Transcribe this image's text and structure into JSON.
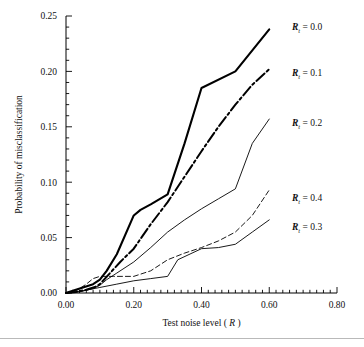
{
  "figure": {
    "background": "#ffffff",
    "line_color": "#000000",
    "footer_rule_color": "#b9b9b9"
  },
  "chart_data": {
    "type": "line",
    "title": "",
    "xlabel_prefix": "Test noise level (",
    "xlabel_symbol": "R",
    "xlabel_suffix": ")",
    "ylabel": "Probability of misclassification",
    "xlim": [
      0.0,
      0.8
    ],
    "ylim": [
      0.0,
      0.25
    ],
    "xticks": [
      0.0,
      0.2,
      0.4,
      0.6,
      0.8
    ],
    "xtick_labels": [
      "0.00",
      "0.20",
      "0.40",
      "0.60",
      "0.80"
    ],
    "yticks": [
      0.0,
      0.05,
      0.1,
      0.15,
      0.2,
      0.25
    ],
    "ytick_labels": [
      "0.00",
      "0.05",
      "0.10",
      "0.15",
      "0.20",
      "0.25"
    ],
    "x_minor_step": 0.02,
    "y_minor_step": 0.01,
    "grid": false,
    "legend_position": "right-inline",
    "series": [
      {
        "name": "Rt = 0.0",
        "label_symbol": "R",
        "label_subscript": "t",
        "label_value": "= 0.0",
        "style": "solid",
        "width": 2.1,
        "x": [
          0.0,
          0.02,
          0.05,
          0.08,
          0.1,
          0.12,
          0.15,
          0.2,
          0.22,
          0.25,
          0.3,
          0.35,
          0.4,
          0.5,
          0.6
        ],
        "y": [
          0.0,
          0.002,
          0.005,
          0.008,
          0.012,
          0.02,
          0.035,
          0.07,
          0.075,
          0.08,
          0.089,
          0.135,
          0.185,
          0.2,
          0.238
        ]
      },
      {
        "name": "Rt = 0.1",
        "label_symbol": "R",
        "label_subscript": "t",
        "label_value": "= 0.1",
        "style": "dashdot",
        "width": 2.0,
        "x": [
          0.0,
          0.03,
          0.06,
          0.09,
          0.1,
          0.13,
          0.16,
          0.2,
          0.25,
          0.3,
          0.35,
          0.4,
          0.45,
          0.5,
          0.55,
          0.6
        ],
        "y": [
          0.0,
          0.001,
          0.003,
          0.006,
          0.008,
          0.018,
          0.028,
          0.04,
          0.062,
          0.082,
          0.105,
          0.128,
          0.15,
          0.17,
          0.188,
          0.202
        ]
      },
      {
        "name": "Rt = 0.2",
        "label_symbol": "R",
        "label_subscript": "t",
        "label_value": "= 0.2",
        "style": "solid",
        "width": 0.9,
        "x": [
          0.0,
          0.04,
          0.08,
          0.1,
          0.12,
          0.15,
          0.2,
          0.25,
          0.3,
          0.35,
          0.4,
          0.45,
          0.5,
          0.55,
          0.6
        ],
        "y": [
          0.0,
          0.001,
          0.004,
          0.007,
          0.012,
          0.018,
          0.028,
          0.041,
          0.055,
          0.066,
          0.076,
          0.085,
          0.094,
          0.135,
          0.157
        ]
      },
      {
        "name": "Rt = 0.4",
        "label_symbol": "R",
        "label_subscript": "t",
        "label_value": "= 0.4",
        "style": "dashed",
        "width": 0.9,
        "x": [
          0.0,
          0.03,
          0.06,
          0.08,
          0.1,
          0.14,
          0.2,
          0.25,
          0.3,
          0.35,
          0.4,
          0.45,
          0.5,
          0.55,
          0.6
        ],
        "y": [
          0.0,
          0.002,
          0.008,
          0.013,
          0.015,
          0.015,
          0.015,
          0.02,
          0.03,
          0.036,
          0.041,
          0.047,
          0.055,
          0.07,
          0.093
        ]
      },
      {
        "name": "Rt = 0.3",
        "label_symbol": "R",
        "label_subscript": "t",
        "label_value": "= 0.3",
        "style": "solid",
        "width": 0.9,
        "x": [
          0.0,
          0.05,
          0.1,
          0.15,
          0.2,
          0.25,
          0.3,
          0.33,
          0.4,
          0.45,
          0.5,
          0.55,
          0.6
        ],
        "y": [
          0.0,
          0.002,
          0.005,
          0.008,
          0.011,
          0.013,
          0.015,
          0.03,
          0.04,
          0.041,
          0.044,
          0.055,
          0.066
        ]
      }
    ],
    "series_labels_order": [
      "Rt = 0.0",
      "Rt = 0.1",
      "Rt = 0.2",
      "Rt = 0.4",
      "Rt = 0.3"
    ]
  }
}
